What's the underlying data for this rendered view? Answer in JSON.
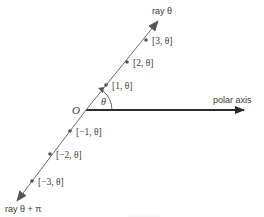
{
  "diagram": {
    "origin_label": "O",
    "angle_label": "θ",
    "polar_axis_label": "polar axis",
    "ray_theta_label": "ray θ",
    "ray_theta_pi_label": "ray θ + π",
    "points": [
      {
        "r": 1,
        "label": "[1, θ]"
      },
      {
        "r": 2,
        "label": "[2, θ]"
      },
      {
        "r": 3,
        "label": "[3, θ]"
      },
      {
        "r": -1,
        "label": "[−1, θ]"
      },
      {
        "r": -2,
        "label": "[−2, θ]"
      },
      {
        "r": -3,
        "label": "[−3, θ]"
      }
    ],
    "colors": {
      "axis": "#2b2b2b",
      "ray": "#6a6a6a",
      "point": "#555555",
      "text": "#3a3a3a"
    }
  }
}
